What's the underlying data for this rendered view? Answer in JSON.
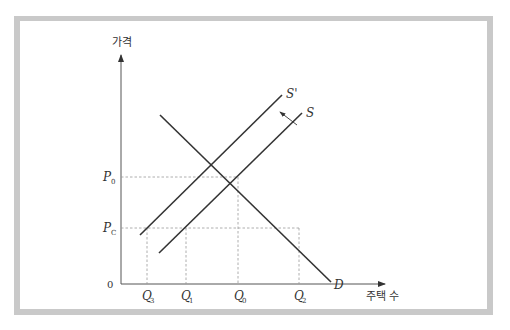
{
  "figure": {
    "y_axis_label": "가격",
    "x_axis_label": "주택 수",
    "origin_label": "0",
    "price_levels": [
      {
        "id": "P0",
        "main": "P",
        "sub": "0"
      },
      {
        "id": "PC",
        "main": "P",
        "sub": "C"
      }
    ],
    "quantity_levels": [
      {
        "id": "Q3",
        "main": "Q",
        "sub": "3"
      },
      {
        "id": "Q1",
        "main": "Q",
        "sub": "1"
      },
      {
        "id": "Q0",
        "main": "Q",
        "sub": "0"
      },
      {
        "id": "Q2",
        "main": "Q",
        "sub": "2"
      }
    ],
    "curves": {
      "supply_shifted": "S'",
      "supply": "S",
      "demand": "D"
    },
    "shift_arrow": "supply shifts left (S → S')"
  },
  "colors": {
    "frame": "#c9c9c9",
    "line": "#333333",
    "guide": "#999999"
  }
}
